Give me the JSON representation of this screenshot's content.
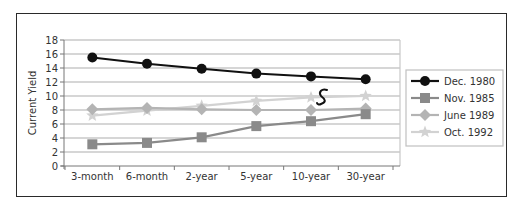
{
  "chart_data": {
    "type": "line",
    "title": "",
    "xlabel": "",
    "ylabel": "Current Yield",
    "ylim": [
      0,
      18
    ],
    "yticks": [
      0,
      2,
      4,
      6,
      8,
      10,
      12,
      14,
      16,
      18
    ],
    "grid": true,
    "legend_position": "right",
    "categories": [
      "3-month",
      "6-month",
      "2-year",
      "5-year",
      "10-year",
      "30-year"
    ],
    "series": [
      {
        "name": "Dec. 1980",
        "marker": "circle",
        "color": "#111111",
        "values": [
          15.5,
          14.6,
          13.9,
          13.2,
          12.8,
          12.4
        ]
      },
      {
        "name": "Nov. 1985",
        "marker": "square",
        "color": "#8a8a8a",
        "values": [
          3.1,
          3.3,
          4.1,
          5.7,
          6.4,
          7.4
        ]
      },
      {
        "name": "June 1989",
        "marker": "diamond",
        "color": "#b4b4b4",
        "values": [
          8.1,
          8.3,
          8.1,
          8.0,
          8.0,
          8.2
        ]
      },
      {
        "name": "Oct. 1992",
        "marker": "star",
        "color": "#d2d2d2",
        "values": [
          7.2,
          7.9,
          8.6,
          9.3,
          9.8,
          10.0
        ]
      }
    ],
    "annotations": [
      {
        "text": "5",
        "type": "handwritten",
        "near": "10-year to 30-year, between Dec. 1980 and Oct. 1992"
      }
    ]
  }
}
